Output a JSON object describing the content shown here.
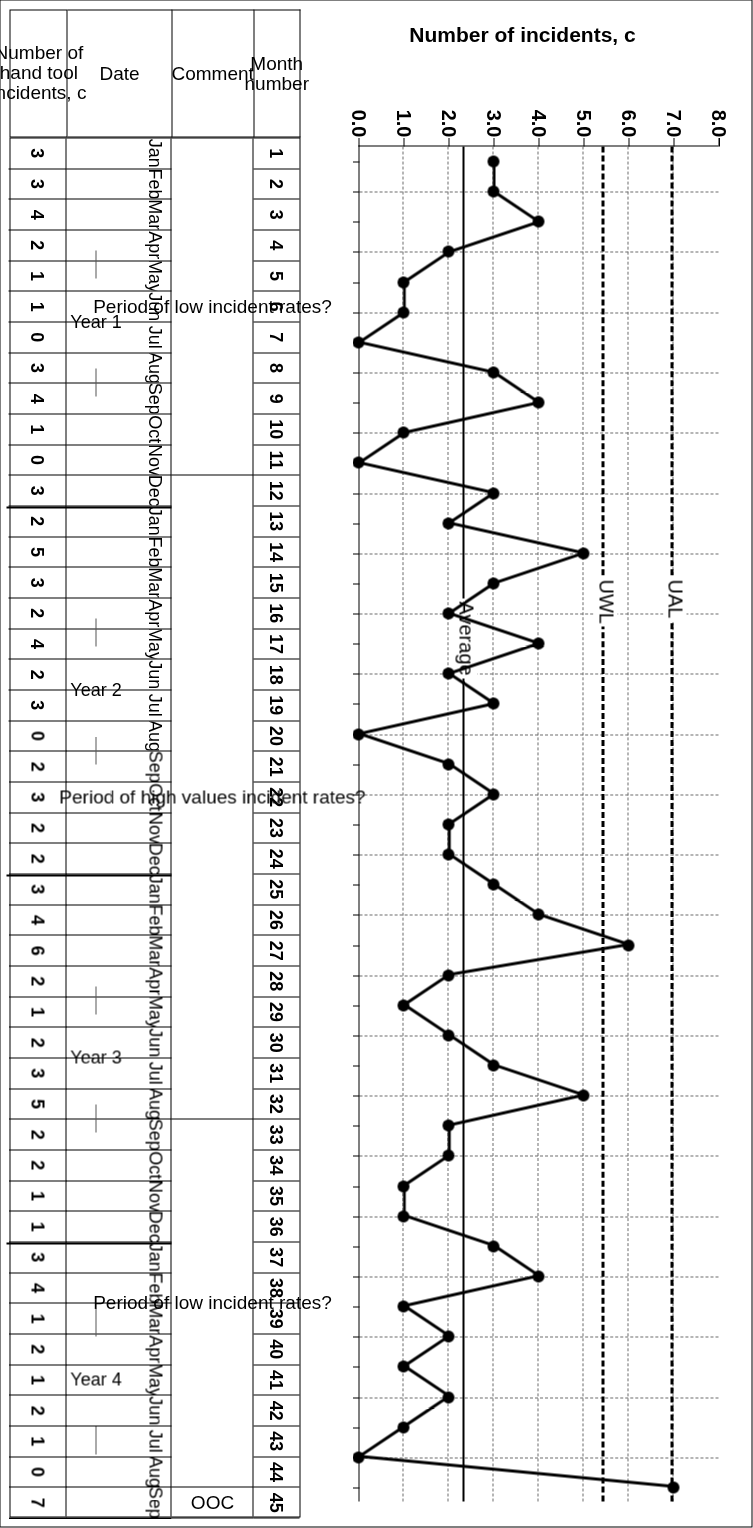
{
  "chart_data": {
    "type": "line",
    "title": "",
    "xlabel": "",
    "ylabel": "Number of incidents, c",
    "ylim": [
      0.0,
      8.0
    ],
    "yticks": [
      "0.0",
      "1.0",
      "2.0",
      "3.0",
      "4.0",
      "5.0",
      "6.0",
      "7.0",
      "8.0"
    ],
    "grid": true,
    "legend": "none",
    "x": [
      1,
      2,
      3,
      4,
      5,
      6,
      7,
      8,
      9,
      10,
      11,
      12,
      13,
      14,
      15,
      16,
      17,
      18,
      19,
      20,
      21,
      22,
      23,
      24,
      25,
      26,
      27,
      28,
      29,
      30,
      31,
      32,
      33,
      34,
      35,
      36,
      37,
      38,
      39,
      40,
      41,
      42,
      43,
      44,
      45
    ],
    "values": [
      3,
      3,
      4,
      2,
      1,
      1,
      0,
      3,
      4,
      1,
      0,
      3,
      2,
      5,
      3,
      2,
      4,
      2,
      3,
      0,
      2,
      3,
      2,
      2,
      3,
      4,
      6,
      2,
      1,
      2,
      3,
      5,
      2,
      2,
      1,
      1,
      3,
      4,
      1,
      2,
      1,
      2,
      1,
      0,
      7
    ],
    "control_limits": [
      {
        "name": "UAL",
        "label": "UAL",
        "value": 7.0,
        "style": "dashed"
      },
      {
        "name": "UWL",
        "label": "UWL",
        "value": 5.47,
        "style": "dashed"
      },
      {
        "name": "Average",
        "label": "Average",
        "value": 2.36,
        "style": "solid"
      }
    ],
    "marker": "filled-circle"
  },
  "table": {
    "headers": {
      "month_number": "Month\nnumber",
      "comment": "Comment",
      "date": "Date",
      "count": "Number of\nhand tool\nincidents, c"
    },
    "rows": [
      {
        "month": "1",
        "date": "Jan",
        "c": "3"
      },
      {
        "month": "2",
        "date": "Feb",
        "c": "3"
      },
      {
        "month": "3",
        "date": "Mar",
        "c": "4"
      },
      {
        "month": "4",
        "date": "Apr",
        "c": "2"
      },
      {
        "month": "5",
        "date": "May",
        "c": "1"
      },
      {
        "month": "6",
        "date": "Jun",
        "c": "1"
      },
      {
        "month": "7",
        "date": "Jul",
        "c": "0"
      },
      {
        "month": "8",
        "date": "Aug",
        "c": "3"
      },
      {
        "month": "9",
        "date": "Sep",
        "c": "4"
      },
      {
        "month": "10",
        "date": "Oct",
        "c": "1"
      },
      {
        "month": "11",
        "date": "Nov",
        "c": "0"
      },
      {
        "month": "12",
        "date": "Dec",
        "c": "3"
      },
      {
        "month": "13",
        "date": "Jan",
        "c": "2"
      },
      {
        "month": "14",
        "date": "Feb",
        "c": "5"
      },
      {
        "month": "15",
        "date": "Mar",
        "c": "3"
      },
      {
        "month": "16",
        "date": "Apr",
        "c": "2"
      },
      {
        "month": "17",
        "date": "May",
        "c": "4"
      },
      {
        "month": "18",
        "date": "Jun",
        "c": "2"
      },
      {
        "month": "19",
        "date": "Jul",
        "c": "3"
      },
      {
        "month": "20",
        "date": "Aug",
        "c": "0"
      },
      {
        "month": "21",
        "date": "Sep",
        "c": "2"
      },
      {
        "month": "22",
        "date": "Oct",
        "c": "3"
      },
      {
        "month": "23",
        "date": "Nov",
        "c": "2"
      },
      {
        "month": "24",
        "date": "Dec",
        "c": "2"
      },
      {
        "month": "25",
        "date": "Jan",
        "c": "3"
      },
      {
        "month": "26",
        "date": "Feb",
        "c": "4"
      },
      {
        "month": "27",
        "date": "Mar",
        "c": "6"
      },
      {
        "month": "28",
        "date": "Apr",
        "c": "2"
      },
      {
        "month": "29",
        "date": "May",
        "c": "1"
      },
      {
        "month": "30",
        "date": "Jun",
        "c": "2"
      },
      {
        "month": "31",
        "date": "Jul",
        "c": "3"
      },
      {
        "month": "32",
        "date": "Aug",
        "c": "5"
      },
      {
        "month": "33",
        "date": "Sep",
        "c": "2"
      },
      {
        "month": "34",
        "date": "Oct",
        "c": "2"
      },
      {
        "month": "35",
        "date": "Nov",
        "c": "1"
      },
      {
        "month": "36",
        "date": "Dec",
        "c": "1"
      },
      {
        "month": "37",
        "date": "Jan",
        "c": "3"
      },
      {
        "month": "38",
        "date": "Feb",
        "c": "4"
      },
      {
        "month": "39",
        "date": "Mar",
        "c": "1"
      },
      {
        "month": "40",
        "date": "Apr",
        "c": "2"
      },
      {
        "month": "41",
        "date": "May",
        "c": "1"
      },
      {
        "month": "42",
        "date": "Jun",
        "c": "2"
      },
      {
        "month": "43",
        "date": "Jul",
        "c": "1"
      },
      {
        "month": "44",
        "date": "Aug",
        "c": "0"
      },
      {
        "month": "45",
        "date": "Sep",
        "c": "7"
      }
    ],
    "comments": [
      {
        "label": "Period of low incident rates?",
        "from": 1,
        "to": 11
      },
      {
        "label": "Period of high values incident rates?",
        "from": 12,
        "to": 32
      },
      {
        "label": "Period of low incident rates?",
        "from": 33,
        "to": 44
      },
      {
        "label": "OOC",
        "from": 45,
        "to": 45
      }
    ],
    "years": [
      {
        "label": "Year 1",
        "from": 1,
        "to": 12
      },
      {
        "label": "Year 2",
        "from": 13,
        "to": 24
      },
      {
        "label": "Year 3",
        "from": 25,
        "to": 36
      },
      {
        "label": "Year 4",
        "from": 37,
        "to": 45
      }
    ],
    "year_boundaries": [
      13,
      25,
      37
    ]
  }
}
